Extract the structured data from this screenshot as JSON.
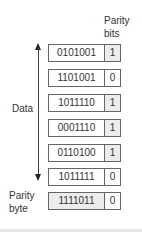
{
  "headers": {
    "parity_bits_line1": "Parity",
    "parity_bits_line2": "bits",
    "data_label": "Data",
    "parity_byte_line1": "Parity",
    "parity_byte_line2": "byte"
  },
  "rows": [
    {
      "data": "0101001",
      "parity": "1",
      "parity_fill": "gray"
    },
    {
      "data": "1101001",
      "parity": "0",
      "parity_fill": "white"
    },
    {
      "data": "1011110",
      "parity": "1",
      "parity_fill": "gray"
    },
    {
      "data": "0001110",
      "parity": "1",
      "parity_fill": "gray"
    },
    {
      "data": "0110100",
      "parity": "1",
      "parity_fill": "gray"
    },
    {
      "data": "1011111",
      "parity": "0",
      "parity_fill": "white"
    }
  ],
  "parity_byte": {
    "data": "1111011",
    "parity": "0",
    "data_fill": "gray",
    "parity_fill": "white"
  },
  "colors": {
    "border": "#666666",
    "gray_fill": "#ececec",
    "arrow": "#222222"
  }
}
